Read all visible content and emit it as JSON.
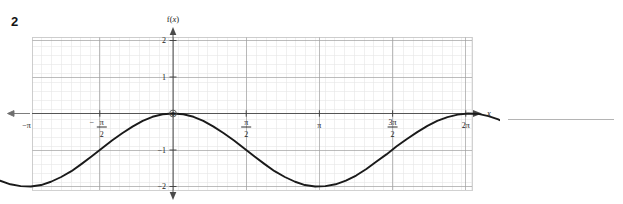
{
  "question": {
    "number": "2"
  },
  "chart_data": {
    "type": "line",
    "title": "",
    "xlabel": "x",
    "ylabel": "f(x)",
    "function": "f(x) = -1 + cos(x)",
    "xlim": [
      -4.15,
      7.55
    ],
    "ylim": [
      -2.35,
      2.35
    ],
    "grid": true,
    "minor_grid": true,
    "legend": null,
    "amplitude": 1,
    "midline": -1,
    "period": "2π",
    "x": [
      -4.15,
      -3.93,
      -3.71,
      -3.49,
      -3.27,
      -3.05,
      -2.83,
      -2.62,
      -2.4,
      -2.18,
      -1.96,
      -1.75,
      -1.53,
      -1.31,
      -1.09,
      -0.87,
      -0.65,
      -0.44,
      -0.22,
      0.0,
      0.22,
      0.44,
      0.65,
      0.87,
      1.09,
      1.31,
      1.53,
      1.75,
      1.96,
      2.18,
      2.4,
      2.62,
      2.83,
      3.05,
      3.27,
      3.49,
      3.71,
      3.93,
      4.15,
      4.36,
      4.58,
      4.8,
      5.02,
      5.24,
      5.46,
      5.67,
      5.89,
      6.11,
      6.33,
      6.55,
      6.77,
      6.98,
      7.2,
      7.42,
      7.55
    ],
    "y": [
      -1.52,
      -1.7,
      -1.84,
      -1.94,
      -1.99,
      -2.0,
      -1.96,
      -1.87,
      -1.74,
      -1.58,
      -1.38,
      -1.18,
      -0.96,
      -0.74,
      -0.54,
      -0.36,
      -0.2,
      -0.09,
      -0.02,
      0.0,
      -0.02,
      -0.09,
      -0.2,
      -0.36,
      -0.54,
      -0.74,
      -0.96,
      -1.18,
      -1.38,
      -1.58,
      -1.74,
      -1.87,
      -1.96,
      -2.0,
      -1.99,
      -1.94,
      -1.84,
      -1.7,
      -1.52,
      -1.32,
      -1.12,
      -0.9,
      -0.7,
      -0.51,
      -0.34,
      -0.2,
      -0.1,
      -0.03,
      0.0,
      -0.01,
      -0.07,
      -0.16,
      -0.3,
      -0.47,
      -0.58
    ],
    "x_ticks": [
      {
        "value": -3.14159,
        "label": "−π",
        "type": "plain"
      },
      {
        "value": -1.5708,
        "label": "−π/2",
        "type": "fraction",
        "sign": "−",
        "numerator": "π",
        "denominator": "2"
      },
      {
        "value": 1.5708,
        "label": "π/2",
        "type": "fraction",
        "sign": "",
        "numerator": "π",
        "denominator": "2"
      },
      {
        "value": 3.14159,
        "label": "π",
        "type": "plain"
      },
      {
        "value": 4.71239,
        "label": "3π/2",
        "type": "fraction",
        "sign": "",
        "numerator": "3π",
        "denominator": "2"
      },
      {
        "value": 6.28319,
        "label": "2π",
        "type": "plain"
      }
    ],
    "y_ticks": [
      {
        "value": 2,
        "label": "2"
      },
      {
        "value": 1,
        "label": "1"
      },
      {
        "value": 0,
        "label": "0"
      },
      {
        "value": -1,
        "label": "−1"
      },
      {
        "value": -2,
        "label": "−2"
      }
    ],
    "origin_label": "0",
    "axis_arrows": [
      "x-right",
      "y-up",
      "y-down",
      "curve-left",
      "curve-right"
    ],
    "curve_color": "#1a1a1a",
    "grid_color_major": "#9a9a9a",
    "grid_color_minor": "#e2e2e2",
    "axis_color": "#4a4a4a"
  },
  "labels": {
    "y_axis_title": "f(x)",
    "x_axis_title": "x",
    "f_part": "f",
    "x_part": "x"
  },
  "answer_line": {
    "present": true,
    "color": "#b4b4b4"
  }
}
